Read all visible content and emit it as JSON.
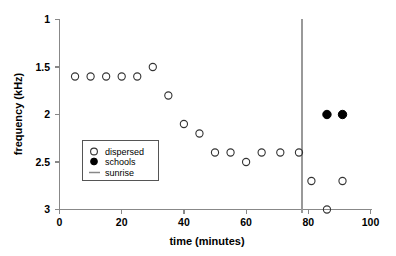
{
  "chart_data": {
    "type": "scatter",
    "title": "",
    "xlabel": "time (minutes)",
    "ylabel": "frequency (kHz)",
    "xlim": [
      0,
      100
    ],
    "ylim": [
      3,
      1
    ],
    "y_inverted": true,
    "grid": false,
    "xticks": [
      0,
      20,
      40,
      60,
      80,
      100
    ],
    "xtick_labels": [
      "0",
      "20",
      "40",
      "60",
      "80",
      "100"
    ],
    "yticks": [
      1,
      1.5,
      2,
      2.5,
      3
    ],
    "ytick_labels": [
      "1",
      "1.5",
      "2",
      "2.5",
      "3"
    ],
    "legend_position": "center-left",
    "series": [
      {
        "name": "dispersed",
        "marker": "open-circle",
        "color": "#333333",
        "points": [
          {
            "x": 5,
            "y": 1.6
          },
          {
            "x": 10,
            "y": 1.6
          },
          {
            "x": 15,
            "y": 1.6
          },
          {
            "x": 20,
            "y": 1.6
          },
          {
            "x": 25,
            "y": 1.6
          },
          {
            "x": 30,
            "y": 1.5
          },
          {
            "x": 35,
            "y": 1.8
          },
          {
            "x": 40,
            "y": 2.1
          },
          {
            "x": 45,
            "y": 2.2
          },
          {
            "x": 50,
            "y": 2.4
          },
          {
            "x": 55,
            "y": 2.4
          },
          {
            "x": 60,
            "y": 2.5
          },
          {
            "x": 65,
            "y": 2.4
          },
          {
            "x": 71,
            "y": 2.4
          },
          {
            "x": 77,
            "y": 2.4
          },
          {
            "x": 81,
            "y": 2.7
          },
          {
            "x": 86,
            "y": 3.0
          },
          {
            "x": 91,
            "y": 2.7
          }
        ]
      },
      {
        "name": "schools",
        "marker": "filled-circle",
        "color": "#000000",
        "points": [
          {
            "x": 86,
            "y": 2.0
          },
          {
            "x": 91,
            "y": 2.0
          }
        ]
      }
    ],
    "annotations": [
      {
        "name": "sunrise",
        "type": "vline",
        "x": 78,
        "color": "#999999"
      }
    ]
  },
  "legend": {
    "entries": [
      {
        "label": "dispersed",
        "marker": "open-circle"
      },
      {
        "label": "schools",
        "marker": "filled-circle"
      },
      {
        "label": "sunrise",
        "marker": "line"
      }
    ]
  },
  "axes": {
    "x_title": "time (minutes)",
    "y_title": "frequency (kHz)"
  }
}
